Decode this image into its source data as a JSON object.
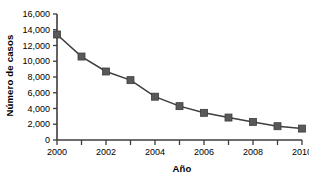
{
  "chart_data": {
    "type": "line",
    "title": "",
    "xlabel": "Año",
    "ylabel": "Número de casos",
    "x": [
      2000,
      2001,
      2002,
      2003,
      2004,
      2005,
      2006,
      2007,
      2008,
      2009,
      2010
    ],
    "values": [
      13400,
      10600,
      8700,
      7600,
      5500,
      4300,
      3450,
      2850,
      2300,
      1750,
      1450
    ],
    "series": [
      {
        "name": "Número de casos",
        "values": [
          13400,
          10600,
          8700,
          7600,
          5500,
          4300,
          3450,
          2850,
          2300,
          1750,
          1450
        ]
      }
    ],
    "xlim": [
      2000,
      2010
    ],
    "ylim": [
      0,
      16000
    ],
    "x_tick_values": [
      2000,
      2001,
      2002,
      2003,
      2004,
      2005,
      2006,
      2007,
      2008,
      2009,
      2010
    ],
    "x_tick_labels": [
      "2000",
      "",
      "2002",
      "",
      "2004",
      "",
      "2006",
      "",
      "2008",
      "",
      "2010"
    ],
    "y_tick_values": [
      0,
      2000,
      4000,
      6000,
      8000,
      10000,
      12000,
      14000,
      16000
    ],
    "y_tick_labels": [
      "0",
      "2,000",
      "4,000",
      "6,000",
      "8,000",
      "10,000",
      "12,000",
      "14,000",
      "16,000"
    ],
    "grid": false,
    "legend": "none",
    "marker": "square",
    "series_color": "#595959",
    "line_color": "#3d3d3d",
    "axis_color": "#3d3d3d",
    "background_color": "#ffffff"
  }
}
